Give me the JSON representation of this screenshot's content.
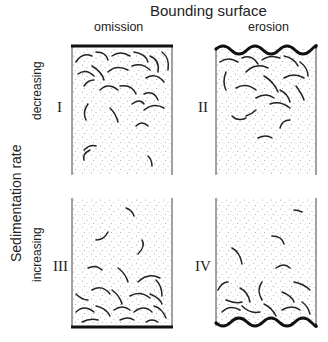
{
  "title": "Bounding surface",
  "columns": [
    {
      "label": "omission"
    },
    {
      "label": "erosion"
    }
  ],
  "row_axis": {
    "label": "Sedimentation rate"
  },
  "rows": [
    {
      "label": "decreasing"
    },
    {
      "label": "increasing"
    }
  ],
  "panels": [
    {
      "id": "I",
      "boundary": "omission",
      "rate": "decreasing",
      "surface_position": "top"
    },
    {
      "id": "II",
      "boundary": "erosion",
      "rate": "decreasing",
      "surface_position": "top"
    },
    {
      "id": "III",
      "boundary": "omission",
      "rate": "increasing",
      "surface_position": "bottom"
    },
    {
      "id": "IV",
      "boundary": "erosion",
      "rate": "increasing",
      "surface_position": "bottom"
    }
  ],
  "colors": {
    "line": "#1a1a1a",
    "stipple": "#9a9a9a",
    "burrow_light": "#666666"
  }
}
